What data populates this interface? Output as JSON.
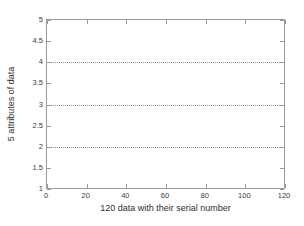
{
  "chart_data": {
    "type": "line",
    "title": "",
    "subtitle": "",
    "xlabel": "120 data with their serial number",
    "ylabel": "5 attributes of data",
    "xlim": [
      0,
      120
    ],
    "ylim": [
      1,
      5
    ],
    "xticks": [
      "0",
      "20",
      "40",
      "60",
      "80",
      "100",
      "120"
    ],
    "xtick_values": [
      0,
      20,
      40,
      60,
      80,
      100,
      120
    ],
    "yticks": [
      "1",
      "1.5",
      "2",
      "2.5",
      "3",
      "3.5",
      "4",
      "4.5",
      "5"
    ],
    "ytick_values": [
      1,
      1.5,
      2,
      2.5,
      3,
      3.5,
      4,
      4.5,
      5
    ],
    "grid": false,
    "legend": null,
    "series": [
      {
        "name": "attribute-line-1",
        "style": "dotted",
        "color": "#8d8d8d",
        "x": [
          0,
          120
        ],
        "values": [
          2,
          2
        ]
      },
      {
        "name": "attribute-line-2",
        "style": "dotted",
        "color": "#8d8d8d",
        "x": [
          0,
          120
        ],
        "values": [
          3,
          3
        ]
      },
      {
        "name": "attribute-line-3",
        "style": "dotted",
        "color": "#8d8d8d",
        "x": [
          0,
          120
        ],
        "values": [
          4,
          4
        ]
      },
      {
        "name": "attribute-line-4",
        "style": "dotted",
        "color": "#8d8d8d",
        "x": [
          0,
          120
        ],
        "values": [
          5,
          5
        ]
      }
    ],
    "annotations": [],
    "axis_color": "#9a9a9a",
    "background": "#ffffff"
  }
}
